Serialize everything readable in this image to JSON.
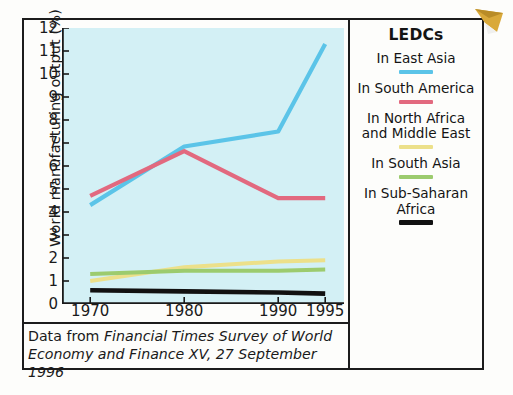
{
  "figure": {
    "y_axis_title": "World manufacturing output (%)",
    "caption": {
      "prefix": "Data from ",
      "italic_source": "Financial Times Survey of World Economy and Finance XV",
      "suffix": ", 27 September 1996"
    }
  },
  "legend": {
    "title": "LEDCs",
    "items": [
      {
        "label": "In East Asia",
        "color": "#5bc4e8"
      },
      {
        "label": "In South America",
        "color": "#e2697f"
      },
      {
        "label": "In North Africa and Middle East",
        "color": "#ece08a"
      },
      {
        "label": "In South Asia",
        "color": "#9ccb6e"
      },
      {
        "label": "In Sub-Saharan Africa",
        "color": "#111111"
      }
    ]
  },
  "decor": {
    "page_corner_icon": "folded-page-corner"
  },
  "chart_data": {
    "type": "line",
    "title": "",
    "xlabel": "",
    "ylabel": "World manufacturing output (%)",
    "x": [
      1970,
      1980,
      1990,
      1995
    ],
    "xtick_labels": [
      "1970",
      "1980",
      "1990",
      "1995"
    ],
    "ytick_labels": [
      "0",
      "1",
      "2",
      "3",
      "4",
      "5",
      "6",
      "7",
      "8",
      "9",
      "10",
      "11",
      "12"
    ],
    "ylim": [
      0,
      12
    ],
    "xlim": [
      1967,
      1997
    ],
    "grid": false,
    "plot_background": "#d3f0f5",
    "legend_position": "right",
    "series": [
      {
        "name": "In East Asia",
        "color": "#5bc4e8",
        "width": 4.2,
        "values": [
          4.3,
          6.85,
          7.5,
          11.3
        ]
      },
      {
        "name": "In South America",
        "color": "#e2697f",
        "width": 4.2,
        "values": [
          4.7,
          6.65,
          4.6,
          4.6
        ]
      },
      {
        "name": "In North Africa and Middle East",
        "color": "#ece08a",
        "width": 4.0,
        "values": [
          1.0,
          1.6,
          1.85,
          1.9
        ]
      },
      {
        "name": "In South Asia",
        "color": "#9ccb6e",
        "width": 4.0,
        "values": [
          1.3,
          1.45,
          1.45,
          1.5
        ]
      },
      {
        "name": "In Sub-Saharan Africa",
        "color": "#111111",
        "width": 4.6,
        "values": [
          0.6,
          0.55,
          0.5,
          0.45
        ]
      }
    ]
  }
}
